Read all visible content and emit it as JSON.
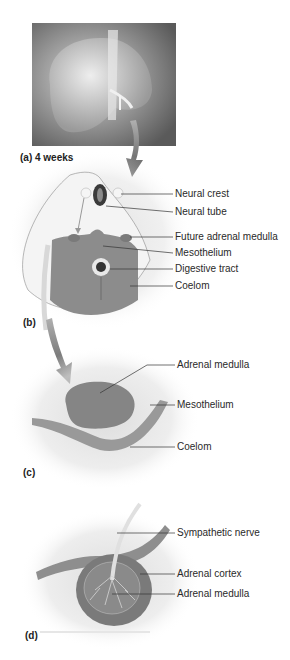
{
  "figure": {
    "panels": [
      {
        "id": "a",
        "label": "(a) 4 weeks",
        "content": "embryo-illustration"
      },
      {
        "id": "b",
        "label": "(b)",
        "labels": [
          "Neural crest",
          "Neural tube",
          "Future adrenal medulla",
          "Mesothelium",
          "Digestive tract",
          "Coelom"
        ]
      },
      {
        "id": "c",
        "label": "(c)",
        "labels": [
          "Adrenal medulla",
          "Mesothelium",
          "Coelom"
        ]
      },
      {
        "id": "d",
        "label": "(d)",
        "labels": [
          "Sympathetic nerve",
          "Adrenal cortex",
          "Adrenal medulla"
        ]
      }
    ]
  }
}
